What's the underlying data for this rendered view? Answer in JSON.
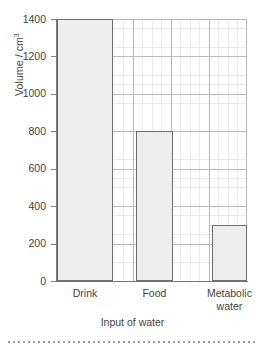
{
  "chart_data": {
    "type": "bar",
    "title": "",
    "categories": [
      "Drink",
      "Food",
      "Metabolic water"
    ],
    "values": [
      1400,
      800,
      300
    ],
    "xlabel": "Input of water",
    "ylabel": "Volume / cm",
    "ylabel_superscript": "3",
    "ylim": [
      0,
      1400
    ],
    "yticks": [
      0,
      200,
      400,
      600,
      800,
      1000,
      1200,
      1400
    ],
    "ytick_labels": [
      "0",
      "200",
      "400",
      "600",
      "800",
      "1000",
      "1200",
      "1400"
    ],
    "grid": "major-and-minor-horizontal-and-vertical",
    "legend": "none",
    "bar_fill_color": "#ededed",
    "bar_border_color": "#6e6e6e",
    "grid_color": "#b9b9b9",
    "minor_grid_color": "#ececec",
    "axis_color": "#777777",
    "text_color": "#3f3f3f"
  },
  "category_lines": [
    [
      "Drink"
    ],
    [
      "Food"
    ],
    [
      "Metabolic",
      "water"
    ]
  ],
  "footer": {
    "divider": "dotted-rule"
  }
}
